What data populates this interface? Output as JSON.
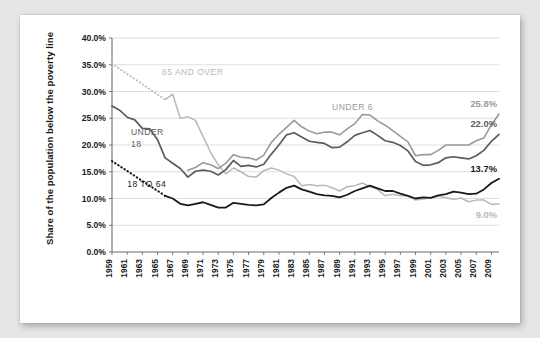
{
  "card": {
    "background_color": "#ffffff",
    "page_background_color": "#e6e6e6"
  },
  "chart_data": {
    "type": "line",
    "title": "",
    "subtitle": "",
    "xlabel": "",
    "ylabel": "Share of the population below the poverty line",
    "xlim": [
      1959,
      2010
    ],
    "ylim": [
      0,
      40
    ],
    "y_tick_step": 5,
    "grid": "horizontal",
    "legend": "in-chart-annotations",
    "y_ticks": [
      "0.0%",
      "5.0%",
      "10.0%",
      "15.0%",
      "20.0%",
      "25.0%",
      "30.0%",
      "35.0%",
      "40.0%"
    ],
    "y_tick_values": [
      0,
      5,
      10,
      15,
      20,
      25,
      30,
      35,
      40
    ],
    "x_ticks": [
      "1959",
      "1961",
      "1963",
      "1965",
      "1967",
      "1969",
      "1971",
      "1973",
      "1975",
      "1977",
      "1979",
      "1981",
      "1983",
      "1985",
      "1987",
      "1989",
      "1991",
      "1993",
      "1995",
      "1997",
      "1999",
      "2001",
      "2003",
      "2005",
      "2007",
      "2009"
    ],
    "x_tick_values": [
      1959,
      1961,
      1963,
      1965,
      1967,
      1969,
      1971,
      1973,
      1975,
      1977,
      1979,
      1981,
      1983,
      1985,
      1987,
      1989,
      1991,
      1993,
      1995,
      1997,
      1999,
      2001,
      2003,
      2005,
      2007,
      2009
    ],
    "x": [
      1959,
      1960,
      1961,
      1962,
      1963,
      1964,
      1965,
      1966,
      1967,
      1968,
      1969,
      1970,
      1971,
      1972,
      1973,
      1974,
      1975,
      1976,
      1977,
      1978,
      1979,
      1980,
      1981,
      1982,
      1983,
      1984,
      1985,
      1986,
      1987,
      1988,
      1989,
      1990,
      1991,
      1992,
      1993,
      1994,
      1995,
      1996,
      1997,
      1998,
      1999,
      2000,
      2001,
      2002,
      2003,
      2004,
      2005,
      2006,
      2007,
      2008,
      2009,
      2010
    ],
    "series": [
      {
        "name": "65 and over",
        "label": "65 AND OVER",
        "color": "#b9b9b9",
        "stroke_width": 1.5,
        "label_x": 1965.6,
        "label_y": 33.0,
        "end_label": "9.0%",
        "end_value": 9.0,
        "dotted_range": [
          1959,
          1966
        ],
        "values": [
          35.2,
          null,
          null,
          null,
          null,
          null,
          null,
          28.5,
          29.5,
          25.0,
          25.3,
          24.6,
          21.6,
          18.6,
          16.3,
          14.6,
          15.7,
          15.0,
          14.1,
          14.0,
          15.2,
          15.7,
          15.3,
          14.6,
          14.1,
          12.4,
          12.6,
          12.4,
          12.5,
          12.0,
          11.4,
          12.2,
          12.4,
          12.9,
          12.2,
          11.7,
          10.5,
          10.8,
          10.5,
          10.5,
          9.7,
          9.9,
          10.1,
          10.4,
          10.2,
          9.8,
          10.1,
          9.4,
          9.7,
          9.7,
          8.9,
          9.0
        ]
      },
      {
        "name": "Under 6",
        "label": "UNDER 6",
        "color": "#9a9a9a",
        "stroke_width": 1.6,
        "label_x": 1988.0,
        "label_y": 26.6,
        "end_label": "25.8%",
        "end_value": 25.8,
        "dotted_range": null,
        "values": [
          null,
          null,
          null,
          null,
          null,
          null,
          null,
          null,
          null,
          null,
          15.3,
          15.8,
          16.7,
          16.3,
          15.6,
          16.6,
          18.2,
          17.7,
          17.6,
          17.2,
          18.1,
          20.5,
          22.0,
          23.3,
          24.6,
          23.4,
          22.6,
          22.1,
          22.4,
          22.4,
          21.9,
          23.0,
          24.0,
          25.7,
          25.6,
          24.5,
          23.7,
          22.7,
          21.6,
          20.6,
          18.0,
          18.2,
          18.2,
          19.0,
          20.0,
          20.0,
          20.0,
          20.0,
          20.8,
          21.3,
          23.8,
          25.8
        ]
      },
      {
        "name": "Under 18",
        "label": "UNDER 18",
        "label_line1": "UNDER",
        "label_line2": "18",
        "color": "#5c5c5c",
        "stroke_width": 1.7,
        "label_x": 1961.5,
        "label_y": 21.8,
        "end_label": "22.0%",
        "end_value": 22.0,
        "dotted_range": null,
        "values": [
          27.3,
          26.5,
          25.2,
          24.7,
          23.1,
          23.0,
          21.0,
          17.6,
          16.6,
          15.6,
          14.0,
          15.1,
          15.3,
          15.1,
          14.4,
          15.4,
          17.1,
          16.0,
          16.2,
          15.9,
          16.4,
          18.3,
          20.0,
          21.9,
          22.3,
          21.5,
          20.7,
          20.5,
          20.3,
          19.5,
          19.6,
          20.6,
          21.8,
          22.3,
          22.7,
          21.8,
          20.8,
          20.5,
          19.9,
          18.9,
          16.9,
          16.2,
          16.3,
          16.7,
          17.6,
          17.8,
          17.6,
          17.4,
          18.0,
          19.0,
          20.7,
          22.0
        ]
      },
      {
        "name": "18 to 64",
        "label": "18 TO 64",
        "color": "#1a1a1a",
        "stroke_width": 1.8,
        "label_x": 1961.0,
        "label_y": 12.2,
        "end_label": "13.7%",
        "end_value": 13.7,
        "dotted_range": [
          1959,
          1966
        ],
        "values": [
          17.0,
          null,
          null,
          null,
          null,
          null,
          null,
          10.5,
          10.0,
          9.0,
          8.7,
          9.0,
          9.3,
          8.8,
          8.3,
          8.3,
          9.2,
          9.0,
          8.8,
          8.7,
          8.9,
          10.1,
          11.1,
          12.0,
          12.4,
          11.7,
          11.3,
          10.8,
          10.6,
          10.5,
          10.2,
          10.7,
          11.4,
          11.9,
          12.4,
          11.9,
          11.4,
          11.4,
          10.9,
          10.5,
          10.0,
          10.2,
          10.1,
          10.6,
          10.8,
          11.3,
          11.1,
          10.8,
          10.9,
          11.7,
          12.9,
          13.7
        ]
      }
    ]
  }
}
